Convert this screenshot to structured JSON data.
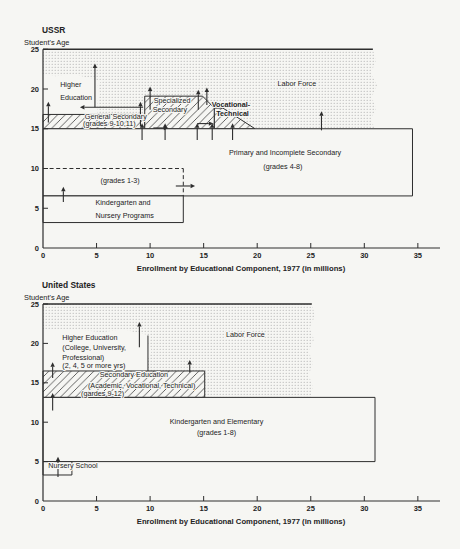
{
  "figure": {
    "bg": "#f6f6f3",
    "ink": "#2e2e2e",
    "stipple_dot": "#a6a6a6",
    "hatch_line": "#3d3d3d"
  },
  "chart_data": [
    {
      "id": "ussr",
      "type": "area",
      "title": "USSR",
      "y_axis_title": "Student's Age",
      "xlabel": "Enrollment by Educational Component, 1977 (in millions)",
      "x_ticks": [
        0,
        5,
        10,
        15,
        20,
        25,
        30,
        35
      ],
      "y_ticks": [
        0,
        5,
        10,
        15,
        20,
        25
      ],
      "xlim": [
        0,
        37
      ],
      "ylim": [
        0,
        25
      ],
      "regions": [
        {
          "name": "labor-force",
          "fill": "stipple",
          "outline": false,
          "points": [
            [
              0,
              15
            ],
            [
              0,
              25
            ],
            [
              30.8,
              25
            ],
            [
              31.1,
              23.5
            ],
            [
              30.6,
              22
            ],
            [
              31.2,
              20.5
            ],
            [
              30.7,
              19
            ],
            [
              31.1,
              17.5
            ],
            [
              30.6,
              16.2
            ],
            [
              31,
              15
            ]
          ]
        },
        {
          "name": "higher-education",
          "fill": "blank",
          "outline": false,
          "points": [
            [
              0,
              16.8
            ],
            [
              5.1,
              16.8
            ],
            [
              5.1,
              18.5
            ],
            [
              5.35,
              19.5
            ],
            [
              5.05,
              20.3
            ],
            [
              5.45,
              21.0
            ],
            [
              4.2,
              21.4
            ],
            [
              2.8,
              21.9
            ],
            [
              1.2,
              21.6
            ],
            [
              0,
              21.9
            ]
          ]
        },
        {
          "name": "general-secondary",
          "fill": "hatch",
          "outline": true,
          "points": [
            [
              0,
              15
            ],
            [
              0,
              16.8
            ],
            [
              9.5,
              16.8
            ],
            [
              9.5,
              15
            ]
          ]
        },
        {
          "name": "specialized-secondary",
          "fill": "hatch",
          "outline": true,
          "points": [
            [
              9.5,
              15
            ],
            [
              9.5,
              19.1
            ],
            [
              14.9,
              19.1
            ],
            [
              16,
              17.6
            ],
            [
              16,
              15
            ]
          ]
        },
        {
          "name": "vocational-technical",
          "fill": "hatch",
          "outline": true,
          "points": [
            [
              16,
              15
            ],
            [
              16,
              17.6
            ],
            [
              16.8,
              17.6
            ],
            [
              19.8,
              15
            ]
          ]
        },
        {
          "name": "primary-and-incomplete-secondary",
          "fill": "blank",
          "outline": true,
          "points": [
            [
              0,
              6.55
            ],
            [
              0,
              15
            ],
            [
              34.5,
              15
            ],
            [
              34.5,
              6.55
            ]
          ]
        },
        {
          "name": "kindergarten-and-nursery",
          "fill": "blank",
          "outline": true,
          "points": [
            [
              0,
              3.2
            ],
            [
              0,
              6.55
            ],
            [
              13.1,
              6.55
            ],
            [
              13.1,
              3.2
            ]
          ]
        }
      ],
      "top_line": [
        [
          0,
          25
        ],
        [
          30.8,
          25
        ]
      ],
      "dashed_lines": [
        [
          [
            0,
            10
          ],
          [
            13.1,
            10
          ]
        ],
        [
          [
            13.1,
            10
          ],
          [
            13.1,
            6.55
          ]
        ]
      ],
      "plain_lines": [],
      "arrows": [
        {
          "x1": 0.5,
          "y1": 15.8,
          "x2": 0.5,
          "y2": 18.4
        },
        {
          "x1": 4.85,
          "y1": 17.7,
          "x2": 4.85,
          "y2": 23.2
        },
        {
          "x1": 9.35,
          "y1": 17.7,
          "x2": 3.45,
          "y2": 17.7
        },
        {
          "x1": 9.1,
          "y1": 15.3,
          "x2": 9.1,
          "y2": 18.4
        },
        {
          "x1": 10.0,
          "y1": 17.4,
          "x2": 10.0,
          "y2": 20.3
        },
        {
          "x1": 14.5,
          "y1": 17.4,
          "x2": 14.5,
          "y2": 19.9
        },
        {
          "x1": 15.3,
          "y1": 18.0,
          "x2": 15.3,
          "y2": 20.2
        },
        {
          "x1": 9.25,
          "y1": 13.6,
          "x2": 9.25,
          "y2": 15.7
        },
        {
          "x1": 11.4,
          "y1": 13.6,
          "x2": 11.4,
          "y2": 15.7
        },
        {
          "x1": 14.4,
          "y1": 13.6,
          "x2": 14.4,
          "y2": 15.7
        },
        {
          "x1": 15.8,
          "y1": 13.6,
          "x2": 15.8,
          "y2": 15.7
        },
        {
          "x1": 17.7,
          "y1": 13.6,
          "x2": 17.7,
          "y2": 15.7
        },
        {
          "x1": 10.3,
          "y1": 15.1,
          "x2": 11.7,
          "y2": 15.1
        },
        {
          "x1": 14.4,
          "y1": 15.65,
          "x2": 15.9,
          "y2": 15.65
        },
        {
          "x1": 26,
          "y1": 14.8,
          "x2": 26,
          "y2": 17.2
        },
        {
          "x1": 1.9,
          "y1": 5.8,
          "x2": 1.9,
          "y2": 7.7
        },
        {
          "x1": 12.4,
          "y1": 7.8,
          "x2": 14.2,
          "y2": 7.8
        }
      ],
      "labels": [
        {
          "text": "Labor Force",
          "x": 23.7,
          "y": 20.4,
          "anchor": "middle",
          "bold": false
        },
        {
          "text": "Higher",
          "x": 1.6,
          "y": 20.3,
          "anchor": "start",
          "bold": false
        },
        {
          "text": "Education",
          "x": 1.6,
          "y": 18.6,
          "anchor": "start",
          "bold": false
        },
        {
          "text": "General Secondary",
          "x": 6.8,
          "y": 16.2,
          "anchor": "middle",
          "bold": false
        },
        {
          "text": "(grades 9-10,11)",
          "x": 6.2,
          "y": 15.3,
          "anchor": "middle",
          "bold": false
        },
        {
          "text": "Specialized",
          "x": 12.05,
          "y": 18.2,
          "anchor": "middle",
          "bold": false
        },
        {
          "text": "Secondary",
          "x": 11.85,
          "y": 17.1,
          "anchor": "middle",
          "bold": false
        },
        {
          "text": "Vocational-",
          "x": 17.55,
          "y": 17.7,
          "anchor": "middle",
          "bold": true
        },
        {
          "text": "Technical",
          "x": 17.7,
          "y": 16.6,
          "anchor": "middle",
          "bold": true
        },
        {
          "text": "Primary and Incomplete Secondary",
          "x": 22.6,
          "y": 11.7,
          "anchor": "middle",
          "bold": false
        },
        {
          "text": "(grades 4-8)",
          "x": 22.4,
          "y": 9.95,
          "anchor": "middle",
          "bold": false
        },
        {
          "text": "(grades 1-3)",
          "x": 7.2,
          "y": 8.2,
          "anchor": "middle",
          "bold": false
        },
        {
          "text": "Kindergarten and",
          "x": 4.9,
          "y": 5.4,
          "anchor": "start",
          "bold": false
        },
        {
          "text": "Nursery Programs",
          "x": 4.9,
          "y": 3.8,
          "anchor": "start",
          "bold": false
        }
      ]
    },
    {
      "id": "us",
      "type": "area",
      "title": "United States",
      "y_axis_title": "Student's Age",
      "xlabel": "Enrollment by Educational Component, 1977 (in millions)",
      "x_ticks": [
        0,
        5,
        10,
        15,
        20,
        25,
        30,
        35
      ],
      "y_ticks": [
        0,
        5,
        10,
        15,
        20,
        25
      ],
      "xlim": [
        0,
        37
      ],
      "ylim": [
        0,
        25
      ],
      "regions": [
        {
          "name": "labor-force",
          "fill": "stipple",
          "outline": false,
          "points": [
            [
              0,
              16.5
            ],
            [
              0,
              25
            ],
            [
              25.1,
              25
            ],
            [
              25.4,
              23.5
            ],
            [
              24.9,
              22
            ],
            [
              25.3,
              20.5
            ],
            [
              24.8,
              19
            ],
            [
              25.2,
              17.5
            ],
            [
              24.8,
              16
            ],
            [
              25.2,
              14.5
            ],
            [
              25.0,
              13.15
            ],
            [
              15.1,
              13.15
            ],
            [
              15.1,
              16.5
            ]
          ]
        },
        {
          "name": "higher-education",
          "fill": "blank",
          "outline": false,
          "points": [
            [
              0,
              16.5
            ],
            [
              9.8,
              16.5
            ],
            [
              9.8,
              18
            ],
            [
              10.15,
              19
            ],
            [
              9.85,
              20
            ],
            [
              10.1,
              21
            ],
            [
              9,
              21.3
            ],
            [
              7.5,
              21.8
            ],
            [
              5.5,
              21.4
            ],
            [
              3,
              21.8
            ],
            [
              0,
              21.7
            ]
          ]
        },
        {
          "name": "secondary-education",
          "fill": "hatch",
          "outline": true,
          "points": [
            [
              0,
              13.15
            ],
            [
              0,
              16.5
            ],
            [
              15.1,
              16.5
            ],
            [
              15.1,
              13.15
            ]
          ]
        },
        {
          "name": "kindergarten-and-elementary",
          "fill": "blank",
          "outline": true,
          "points": [
            [
              0,
              5
            ],
            [
              0,
              13.15
            ],
            [
              31,
              13.15
            ],
            [
              31,
              5
            ]
          ]
        },
        {
          "name": "nursery-school",
          "fill": "blank",
          "outline": true,
          "points": [
            [
              0,
              3.3
            ],
            [
              0,
              5
            ],
            [
              2.7,
              5
            ],
            [
              2.7,
              3.3
            ]
          ]
        }
      ],
      "top_line": [
        [
          0,
          25
        ],
        [
          25.1,
          25
        ]
      ],
      "dashed_lines": [],
      "plain_lines": [
        [
          [
            9.8,
            16.5
          ],
          [
            9.8,
            21.0
          ]
        ]
      ],
      "arrows": [
        {
          "x1": 0.9,
          "y1": 15.6,
          "x2": 0.9,
          "y2": 17.6
        },
        {
          "x1": 0.9,
          "y1": 11.5,
          "x2": 0.9,
          "y2": 13.7
        },
        {
          "x1": 13.7,
          "y1": 16.3,
          "x2": 13.7,
          "y2": 17.9
        },
        {
          "x1": 9.0,
          "y1": 19.5,
          "x2": 9.0,
          "y2": 22.7
        },
        {
          "x1": 1.4,
          "y1": 3.05,
          "x2": 1.4,
          "y2": 5.6
        }
      ],
      "labels": [
        {
          "text": "Labor Force",
          "x": 18.9,
          "y": 20.8,
          "anchor": "middle",
          "bold": false
        },
        {
          "text": "Higher Education",
          "x": 1.8,
          "y": 20.4,
          "anchor": "start",
          "bold": false
        },
        {
          "text": "(College, University,",
          "x": 1.8,
          "y": 19.2,
          "anchor": "start",
          "bold": false
        },
        {
          "text": "Professional)",
          "x": 1.8,
          "y": 17.95,
          "anchor": "start",
          "bold": false
        },
        {
          "text": "(2, 4, 5 or more yrs)",
          "x": 1.8,
          "y": 16.9,
          "anchor": "start",
          "bold": false
        },
        {
          "text": "Secondary Education",
          "x": 5.3,
          "y": 15.75,
          "anchor": "start",
          "bold": false
        },
        {
          "text": "(Academic, Vocational, Technical)",
          "x": 4.2,
          "y": 14.35,
          "anchor": "start",
          "bold": false
        },
        {
          "text": "(gardes 9-12)",
          "x": 3.55,
          "y": 13.35,
          "anchor": "start",
          "bold": false
        },
        {
          "text": "Kindergarten and Elementary",
          "x": 16.2,
          "y": 9.8,
          "anchor": "middle",
          "bold": false
        },
        {
          "text": "(grades 1-8)",
          "x": 16.2,
          "y": 8.4,
          "anchor": "middle",
          "bold": false
        },
        {
          "text": "Nursery School",
          "x": 0.5,
          "y": 4.2,
          "anchor": "start",
          "bold": false
        }
      ]
    }
  ]
}
